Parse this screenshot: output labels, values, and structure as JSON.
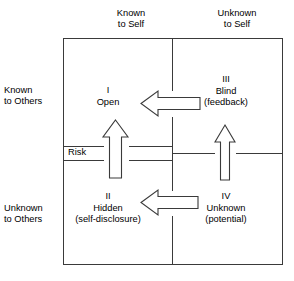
{
  "diagram": {
    "type": "johari-window",
    "colors": {
      "stroke": "#3a3a3a",
      "text": "#000000",
      "background": "#ffffff",
      "arrow_fill": "#ffffff"
    },
    "column_headers": [
      {
        "id": "known-self",
        "line1": "Known",
        "line2": "to Self"
      },
      {
        "id": "unknown-self",
        "line1": "Unknown",
        "line2": "to Self"
      }
    ],
    "row_headers": [
      {
        "id": "known-others",
        "line1": "Known",
        "line2": "to Others"
      },
      {
        "id": "unknown-others",
        "line1": "Unknown",
        "line2": "to Others"
      }
    ],
    "quadrants": [
      {
        "id": "open",
        "roman": "I",
        "name": "Open",
        "paren": ""
      },
      {
        "id": "hidden",
        "roman": "II",
        "name": "Hidden",
        "paren": "(self-disclosure)"
      },
      {
        "id": "blind",
        "roman": "III",
        "name": "Blind",
        "paren": "(feedback)"
      },
      {
        "id": "unknown",
        "roman": "IV",
        "name": "Unknown",
        "paren": "(potential)"
      }
    ],
    "band_label": "Risk",
    "arrows": [
      {
        "id": "feedback-arrow-top",
        "direction": "left",
        "from": "blind",
        "to": "open"
      },
      {
        "id": "disclosure-arrow-bottom",
        "direction": "left",
        "from": "unknown",
        "to": "hidden"
      },
      {
        "id": "risk-arrow-left",
        "direction": "up",
        "from": "hidden",
        "to": "open"
      },
      {
        "id": "feedback-arrow-right",
        "direction": "up",
        "from": "unknown",
        "to": "blind"
      }
    ]
  }
}
